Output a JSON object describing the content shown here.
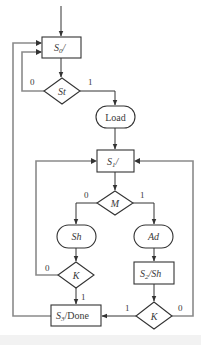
{
  "diagram": {
    "type": "ASM chart / flowchart",
    "colors": {
      "line": "#333333",
      "loop_line": "#8a8a8a",
      "node_fill": "#ffffff",
      "text": "#3a3a3a"
    },
    "nodes": {
      "s0": {
        "kind": "state-box",
        "main": "S",
        "sub": "0",
        "tail": "/"
      },
      "st": {
        "kind": "decision",
        "label": "St"
      },
      "load": {
        "kind": "conditional-output",
        "label": "Load"
      },
      "s1": {
        "kind": "state-box",
        "main": "S",
        "sub": "1",
        "tail": "/"
      },
      "m": {
        "kind": "decision",
        "label": "M"
      },
      "sh": {
        "kind": "conditional-output",
        "label": "Sh"
      },
      "ad": {
        "kind": "conditional-output",
        "label": "Ad"
      },
      "k_left": {
        "kind": "decision",
        "label": "K"
      },
      "s2": {
        "kind": "state-box",
        "main": "S",
        "sub": "2",
        "tail": "/Sh"
      },
      "k_right": {
        "kind": "decision",
        "label": "K"
      },
      "s3": {
        "kind": "state-box",
        "main": "S",
        "sub": "3",
        "tail": "/Done"
      }
    },
    "branches": {
      "st_0": "0",
      "st_1": "1",
      "m_0": "0",
      "m_1": "1",
      "k_left_0": "0",
      "k_left_1": "1",
      "k_right_1": "1",
      "k_right_0": "0"
    },
    "edges": [
      {
        "from": "entry",
        "to": "s0"
      },
      {
        "from": "s0",
        "to": "st"
      },
      {
        "from": "st",
        "to": "s0",
        "label": "0"
      },
      {
        "from": "st",
        "to": "load",
        "label": "1"
      },
      {
        "from": "load",
        "to": "s1"
      },
      {
        "from": "s1",
        "to": "m"
      },
      {
        "from": "m",
        "to": "sh",
        "label": "0"
      },
      {
        "from": "m",
        "to": "ad",
        "label": "1"
      },
      {
        "from": "sh",
        "to": "k_left"
      },
      {
        "from": "k_left",
        "to": "s1",
        "label": "0"
      },
      {
        "from": "k_left",
        "to": "s3",
        "label": "1"
      },
      {
        "from": "ad",
        "to": "s2"
      },
      {
        "from": "s2",
        "to": "k_right"
      },
      {
        "from": "k_right",
        "to": "s3",
        "label": "1"
      },
      {
        "from": "k_right",
        "to": "s1",
        "label": "0"
      },
      {
        "from": "s3",
        "to": "s0"
      }
    ]
  }
}
